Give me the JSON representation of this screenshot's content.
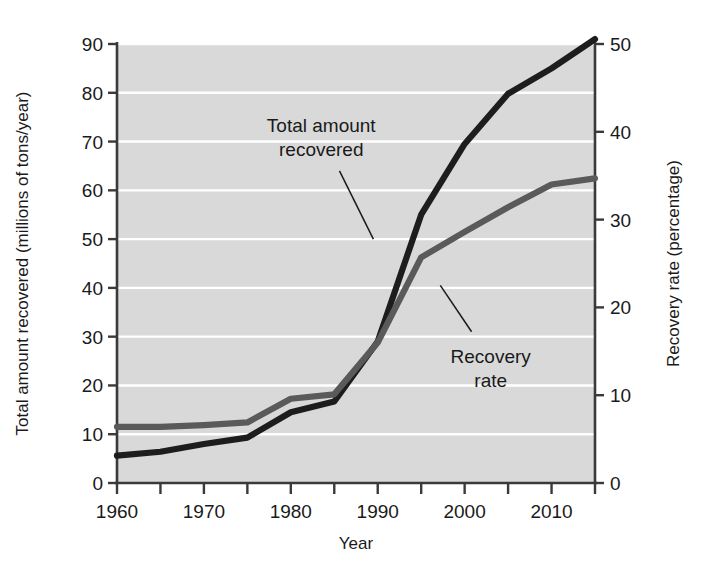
{
  "chart_data": {
    "type": "line",
    "title": "",
    "xlabel": "Year",
    "ylabel": "Total amount recovered (millions of tons/year)",
    "y2label": "Recovery rate (percentage)",
    "x": [
      1960,
      1965,
      1970,
      1975,
      1980,
      1985,
      1990,
      1995,
      2000,
      2005,
      2010,
      2015
    ],
    "xlim": [
      1960,
      2015
    ],
    "ylim": [
      0,
      90
    ],
    "y2lim": [
      0,
      50
    ],
    "xticks": [
      1960,
      1970,
      1980,
      1990,
      2000,
      2010
    ],
    "xticklabels": [
      "1960",
      "1970",
      "1980",
      "1990",
      "2000",
      "2010"
    ],
    "xminorticks": [
      1965,
      1975,
      1985,
      1995,
      2005,
      2015
    ],
    "yticks": [
      0,
      10,
      20,
      30,
      40,
      50,
      60,
      70,
      80,
      90
    ],
    "yticklabels": [
      "0",
      "10",
      "20",
      "30",
      "40",
      "50",
      "60",
      "70",
      "80",
      "90"
    ],
    "y2ticks": [
      0,
      10,
      20,
      30,
      40,
      50
    ],
    "y2ticklabels": [
      "0",
      "10",
      "20",
      "30",
      "40",
      "50"
    ],
    "grid": "horizontal-white",
    "plot_background": "#d9d9d9",
    "series": [
      {
        "name": "Total amount recovered",
        "axis": "left",
        "color": "#1d1d1d",
        "values": [
          5.6,
          6.4,
          8.0,
          9.3,
          14.5,
          16.7,
          29.0,
          55.0,
          69.5,
          79.8,
          85.0,
          91.0
        ]
      },
      {
        "name": "Recovery rate",
        "axis": "right",
        "color": "#5a5a5a",
        "values": [
          6.4,
          6.4,
          6.6,
          6.9,
          9.6,
          10.1,
          16.0,
          25.7,
          28.6,
          31.4,
          34.0,
          34.7
        ]
      }
    ],
    "annotations": [
      {
        "id": "total-amount-recovered",
        "lines": [
          "Total amount",
          "recovered"
        ],
        "text_x": 1983.5,
        "text_y": 72,
        "leader_from": [
          1985.6,
          64.0
        ],
        "leader_to": [
          1989.5,
          50.0
        ]
      },
      {
        "id": "recovery-rate",
        "lines": [
          "Recovery",
          "rate"
        ],
        "text_x": 2003.0,
        "text_y": 24.5,
        "leader_from": [
          2000.8,
          31.0
        ],
        "leader_to": [
          1997.2,
          40.5
        ]
      }
    ],
    "legend": "inline-annotations"
  }
}
